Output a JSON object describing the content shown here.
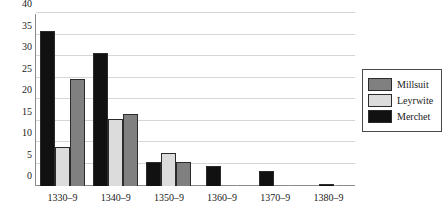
{
  "chart_data": {
    "type": "bar",
    "title": "",
    "subtitle": "",
    "xlabel": "",
    "ylabel": "",
    "categories": [
      "1330–9",
      "1340–9",
      "1350–9",
      "1360–9",
      "1370–9",
      "1380–9"
    ],
    "series": [
      {
        "name": "Merchet",
        "color": "#111111",
        "values": [
          36,
          31,
          5.7,
          4.7,
          3.6,
          0.5
        ]
      },
      {
        "name": "Leyrwite",
        "color": "#dcdcdc",
        "values": [
          9,
          15.7,
          7.7,
          0,
          0,
          0.1
        ]
      },
      {
        "name": "Millsuit",
        "color": "#808080",
        "values": [
          25,
          16.7,
          5.6,
          0.1,
          0.1,
          0.1
        ]
      }
    ],
    "ylim": [
      0,
      40
    ],
    "yticks": [
      0,
      5,
      10,
      15,
      20,
      25,
      30,
      35,
      40
    ],
    "ytick_labels": [
      "0",
      "5",
      "10",
      "15",
      "20",
      "25",
      "30",
      "35",
      "40"
    ],
    "grid": "horizontal",
    "legend_position": "right",
    "bar_order_in_group": [
      "Merchet",
      "Leyrwite",
      "Millsuit"
    ]
  },
  "legend": {
    "entries": [
      {
        "label": "Millsuit",
        "color": "#808080"
      },
      {
        "label": "Leyrwite",
        "color": "#dcdcdc"
      },
      {
        "label": "Merchet",
        "color": "#111111"
      }
    ]
  },
  "colors": {
    "axis": "#8a8a8a",
    "gridline": "#d6d6d6",
    "text": "#1a1a1a",
    "bar_outline": "#2b2b2b",
    "background": "#ffffff"
  }
}
